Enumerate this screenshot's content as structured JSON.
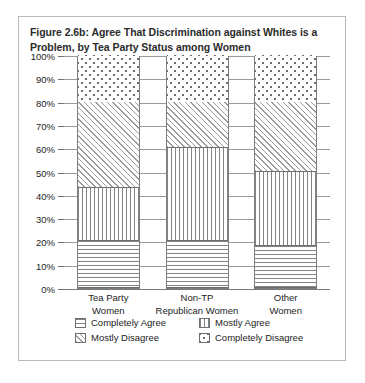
{
  "figure": {
    "title": "Figure 2.6b: Agree That Discrimination against Whites is a Problem, by Tea Party Status among Women"
  },
  "chart_data": {
    "type": "bar",
    "subtype": "stacked-bar-100",
    "title": "Figure 2.6b: Agree That Discrimination against Whites is a Problem, by Tea Party Status among Women",
    "xlabel": "",
    "ylabel": "",
    "ylim": [
      0,
      100
    ],
    "grid": true,
    "legend_position": "bottom",
    "categories": [
      "Tea Party Women",
      "Non-TP Republican Women",
      "Other Women"
    ],
    "category_lines": [
      [
        "Tea Party",
        "Women"
      ],
      [
        "Non-TP",
        "Republican Women"
      ],
      [
        "Other",
        "Women"
      ]
    ],
    "ytick_labels": [
      "0%",
      "10%",
      "20%",
      "30%",
      "40%",
      "50%",
      "60%",
      "70%",
      "80%",
      "90%",
      "100%"
    ],
    "ytick_values": [
      0,
      10,
      20,
      30,
      40,
      50,
      60,
      70,
      80,
      90,
      100
    ],
    "series": [
      {
        "name": "Completely Agree",
        "pattern": "horizontal-lines",
        "values": [
          20,
          20,
          18
        ]
      },
      {
        "name": "Mostly Agree",
        "pattern": "vertical-lines",
        "values": [
          23,
          40,
          32
        ]
      },
      {
        "name": "Mostly Disagree",
        "pattern": "diagonal-hatch",
        "values": [
          37,
          20,
          30
        ]
      },
      {
        "name": "Completely Disagree",
        "pattern": "dots",
        "values": [
          20,
          20,
          20
        ]
      }
    ]
  }
}
